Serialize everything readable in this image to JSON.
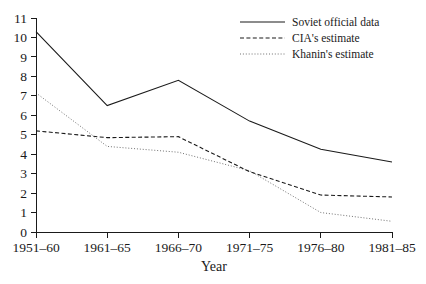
{
  "chart_data": {
    "type": "line",
    "title": "",
    "xlabel": "Year",
    "ylabel": "",
    "categories": [
      "1951–60",
      "1961–65",
      "1966–70",
      "1971–75",
      "1976–80",
      "1981–85"
    ],
    "ylim": [
      0,
      11
    ],
    "yticks": [
      0,
      1,
      2,
      3,
      4,
      5,
      6,
      7,
      8,
      9,
      10,
      11
    ],
    "ytick_labels": [
      "0",
      "1",
      "2",
      "3",
      "4",
      "5",
      "6",
      "7",
      "8",
      "9",
      "10",
      "11"
    ],
    "grid": false,
    "legend_position": "top-right",
    "series": [
      {
        "name": "Soviet official data",
        "style": "solid",
        "color": "#1a1a1a",
        "values": [
          10.3,
          6.5,
          7.8,
          5.7,
          4.25,
          3.6
        ]
      },
      {
        "name": "CIA's estimate",
        "style": "dashed",
        "color": "#1a1a1a",
        "values": [
          5.2,
          4.85,
          4.9,
          3.1,
          1.9,
          1.8
        ]
      },
      {
        "name": "Khanin's estimate",
        "style": "dotted",
        "color": "#8a8a8a",
        "values": [
          7.15,
          4.4,
          4.1,
          3.15,
          1.0,
          0.55
        ]
      }
    ]
  },
  "axes": {
    "x_axis_title": "Year",
    "y_axis_title": ""
  },
  "legend": {
    "items": [
      {
        "label": "Soviet official data",
        "style": "solid"
      },
      {
        "label": "CIA's estimate",
        "style": "dashed"
      },
      {
        "label": "Khanin's estimate",
        "style": "dotted"
      }
    ]
  }
}
